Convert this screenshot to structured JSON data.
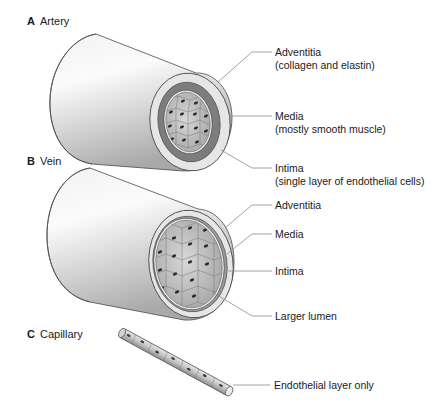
{
  "figure": {
    "panels": [
      {
        "id": "A",
        "letter": "A",
        "title": "Artery",
        "callouts": [
          {
            "label": "Adventitia",
            "sublabel": "(collagen and elastin)"
          },
          {
            "label": "Media",
            "sublabel": "(mostly smooth muscle)"
          },
          {
            "label": "Intima",
            "sublabel": "(single layer of endothelial cells)"
          }
        ]
      },
      {
        "id": "B",
        "letter": "B",
        "title": "Vein",
        "callouts": [
          {
            "label": "Adventitia"
          },
          {
            "label": "Media"
          },
          {
            "label": "Intima"
          },
          {
            "label": "Larger lumen"
          }
        ]
      },
      {
        "id": "C",
        "letter": "C",
        "title": "Capillary",
        "callouts": [
          {
            "label": "Endothelial layer only"
          }
        ]
      }
    ],
    "colors": {
      "background": "#ffffff",
      "outline": "#3a3a3a",
      "adventitia": "#e4e4e4",
      "media": "#7d7d7d",
      "intima": "#c9c9c9",
      "nucleus": "#2b2b2b",
      "leader_line": "#8a8a8a"
    }
  }
}
